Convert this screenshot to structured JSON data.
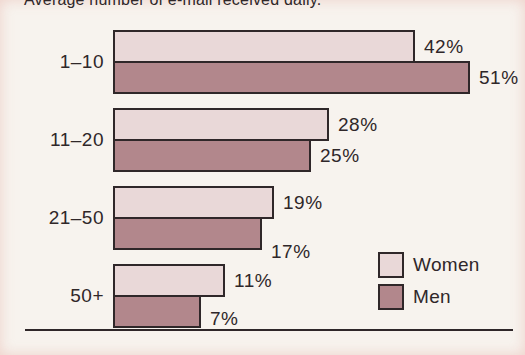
{
  "title": "Average number of e-mail received daily.",
  "chart_data": {
    "type": "bar",
    "orientation": "horizontal",
    "title": "Average number of e-mail received daily.",
    "categories": [
      "1–10",
      "11–20",
      "21–50",
      "50+"
    ],
    "series": [
      {
        "name": "Women",
        "color": "#e9d8d8",
        "values": [
          42,
          28,
          19,
          11
        ]
      },
      {
        "name": "Men",
        "color": "#b2878c",
        "values": [
          51,
          25,
          17,
          7
        ]
      }
    ],
    "value_labels": [
      [
        "42%",
        "28%",
        "19%",
        "11%"
      ],
      [
        "51%",
        "25%",
        "17%",
        "7%"
      ]
    ],
    "value_suffix": "%",
    "xlabel": "",
    "ylabel": "",
    "axis": {
      "baseline_visible": true,
      "gridlines": false
    },
    "legend_position": "bottom-right"
  },
  "colors": {
    "background": "#f7f3ee",
    "bar_border": "#2f2729",
    "text": "#2f2729",
    "women": "#e9d8d8",
    "men": "#b2878c"
  }
}
